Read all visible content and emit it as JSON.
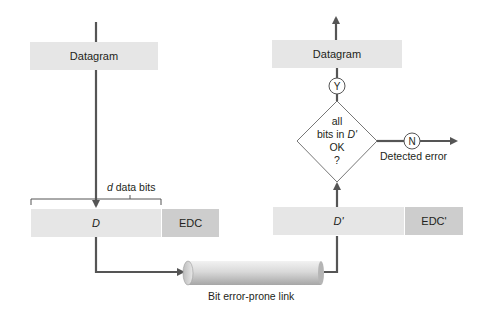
{
  "sender": {
    "datagram_label": "Datagram",
    "data_label": "D",
    "edc_label": "EDC",
    "bracket_label_var": "d",
    "bracket_label_rest": " data bits"
  },
  "link": {
    "label": "Bit error-prone link"
  },
  "receiver": {
    "datagram_label": "Datagram",
    "data_label": "D'",
    "edc_label": "EDC'",
    "decision": {
      "line1": "all",
      "line2_prefix": "bits in ",
      "line2_var": "D'",
      "line3": "OK",
      "line4": "?"
    },
    "yes_label": "Y",
    "no_label": "N",
    "error_label": "Detected error"
  },
  "colors": {
    "line": "#555555",
    "box_light": "#e6e6e6",
    "box_dark": "#cdcdcd"
  }
}
